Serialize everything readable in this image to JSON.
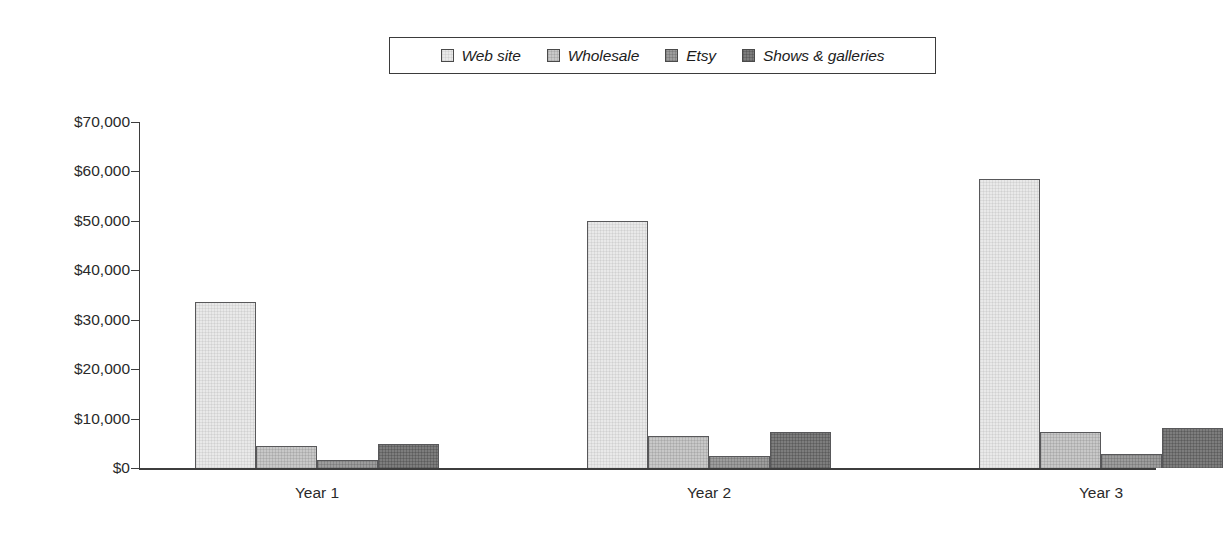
{
  "chart_data": {
    "type": "bar",
    "title": "",
    "subtitle": "",
    "xlabel": "",
    "ylabel": "",
    "categories": [
      "Year 1",
      "Year 2",
      "Year 3"
    ],
    "series": [
      {
        "name": "Web site",
        "values": [
          33500,
          50000,
          58500
        ],
        "color": "#e9e9e9"
      },
      {
        "name": "Wholesale",
        "values": [
          4500,
          6400,
          7300
        ],
        "color": "#c8c8c8"
      },
      {
        "name": "Etsy",
        "values": [
          1600,
          2500,
          2800
        ],
        "color": "#9d9d9d"
      },
      {
        "name": "Shows & galleries",
        "values": [
          4900,
          7300,
          8100
        ],
        "color": "#7d7d7d"
      }
    ],
    "ylim": [
      0,
      70000
    ],
    "ytick_values": [
      0,
      10000,
      20000,
      30000,
      40000,
      50000,
      60000,
      70000
    ],
    "ytick_labels": [
      "$0",
      "$10,000",
      "$20,000",
      "$30,000",
      "$40,000",
      "$50,000",
      "$60,000",
      "$70,000"
    ],
    "grid": false,
    "legend_position": "top-center",
    "value_prefix": "$"
  },
  "legend": {
    "items": [
      {
        "label": "Web site"
      },
      {
        "label": "Wholesale"
      },
      {
        "label": "Etsy"
      },
      {
        "label": "Shows & galleries"
      }
    ]
  },
  "axes": {
    "y_labels": [
      "$70,000",
      "$60,000",
      "$50,000",
      "$40,000",
      "$30,000",
      "$20,000",
      "$10,000",
      "$0"
    ],
    "x_labels": [
      "Year 1",
      "Year 2",
      "Year 3"
    ]
  }
}
